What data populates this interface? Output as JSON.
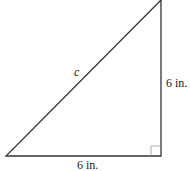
{
  "diagram": {
    "type": "right-triangle",
    "hypotenuse_label": "c",
    "base_label": "6 in.",
    "height_label": "6 in.",
    "right_angle_marker": true,
    "stroke_color": "#333333"
  }
}
